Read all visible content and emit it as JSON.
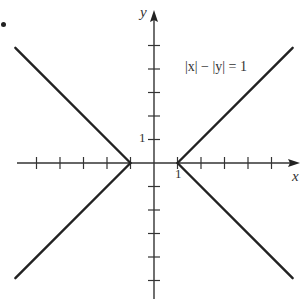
{
  "chart_data": {
    "type": "line",
    "title": "",
    "annotation": "|x| − |y| = 1",
    "xlabel": "x",
    "ylabel": "y",
    "xlim": [
      -6,
      6
    ],
    "ylim": [
      -6,
      6
    ],
    "grid": false,
    "x_ticks": [
      -5,
      -4,
      -3,
      -2,
      -1,
      1,
      2,
      3,
      4,
      5
    ],
    "y_ticks": [
      -5,
      -4,
      -3,
      -2,
      -1,
      1,
      2,
      3,
      4,
      5
    ],
    "tick_labels": {
      "x": [
        "1"
      ],
      "y": [
        "1"
      ]
    },
    "series": [
      {
        "name": "upper-right",
        "x": [
          1,
          5.9
        ],
        "y": [
          0,
          4.9
        ]
      },
      {
        "name": "lower-right",
        "x": [
          1,
          5.9
        ],
        "y": [
          0,
          -4.9
        ]
      },
      {
        "name": "upper-left",
        "x": [
          -1,
          -5.9
        ],
        "y": [
          0,
          4.9
        ]
      },
      {
        "name": "lower-left",
        "x": [
          -1,
          -5.9
        ],
        "y": [
          0,
          -4.9
        ]
      }
    ]
  },
  "labels": {
    "x_axis": "x",
    "y_axis": "y",
    "x_tick_one": "1",
    "y_tick_one": "1",
    "equation": "|x| − |y| = 1"
  }
}
